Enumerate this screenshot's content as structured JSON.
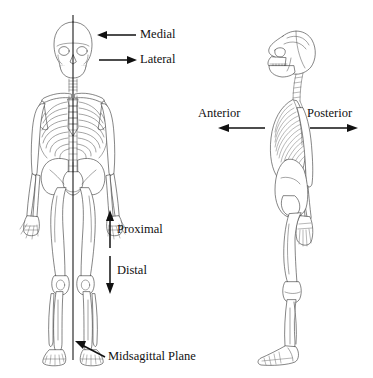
{
  "figure": {
    "background_color": "#ffffff",
    "line_color": "#3a3a3a",
    "text_color": "#111111"
  },
  "labels": {
    "medial": "Medial",
    "lateral": "Lateral",
    "proximal": "Proximal",
    "distal": "Distal",
    "midsagittal_plane": "Midsagittal Plane",
    "anterior": "Anterior",
    "posterior": "Posterior"
  },
  "annotations": [
    {
      "id": "medial",
      "text": "Medial",
      "arrow_direction": "left",
      "label_x": 140,
      "label_y": 28
    },
    {
      "id": "lateral",
      "text": "Lateral",
      "arrow_direction": "right",
      "label_x": 140,
      "label_y": 53
    },
    {
      "id": "proximal",
      "text": "Proximal",
      "arrow_direction": "up",
      "label_x": 116,
      "label_y": 223
    },
    {
      "id": "distal",
      "text": "Distal",
      "arrow_direction": "down",
      "label_x": 116,
      "label_y": 264
    },
    {
      "id": "midsagittal-plane",
      "text": "Midsagittal Plane",
      "arrow_direction": "up-left",
      "label_x": 108,
      "label_y": 350
    },
    {
      "id": "anterior",
      "text": "Anterior",
      "arrow_direction": "left",
      "label_x": 198,
      "label_y": 106
    },
    {
      "id": "posterior",
      "text": "Posterior",
      "arrow_direction": "right",
      "label_x": 308,
      "label_y": 106
    }
  ],
  "figures": [
    {
      "id": "anterior-view-skeleton",
      "view": "anterior",
      "description": "Full human skeleton, front view, with vertical midsagittal plane line"
    },
    {
      "id": "lateral-view-skeleton",
      "view": "lateral",
      "description": "Full human skeleton, left lateral view, facing left"
    }
  ]
}
